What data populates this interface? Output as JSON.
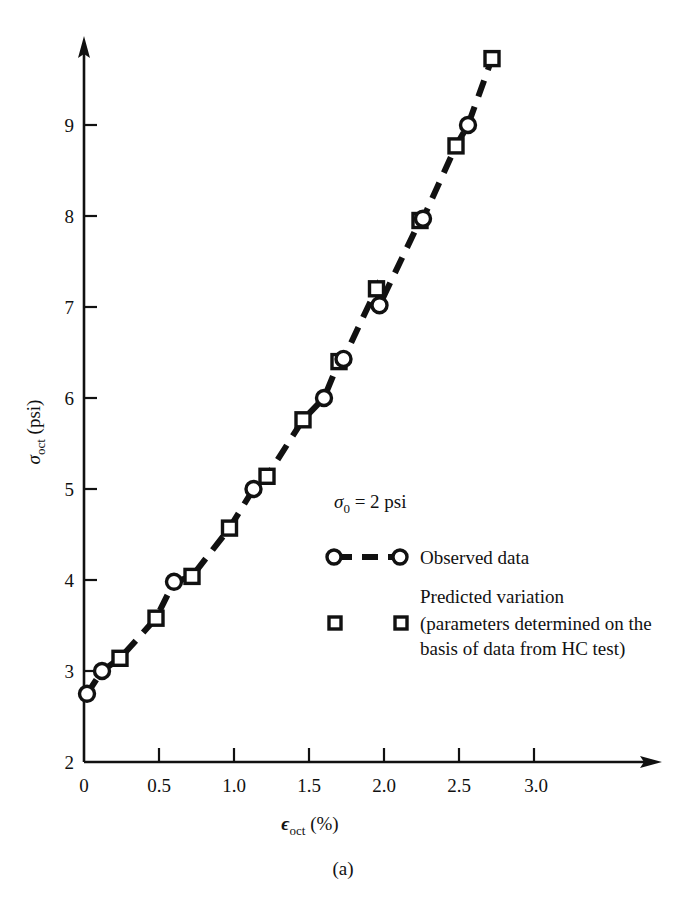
{
  "figure": {
    "caption": "(a)",
    "annotation": "= 2 psi",
    "annotation_symbol": "σ",
    "annotation_subscript": "0"
  },
  "axes": {
    "y_title_symbol": "σ",
    "y_title_sub": "oct",
    "y_title_unit": "(psi)",
    "x_title_symbol": "ϵ",
    "x_title_sub": "oct",
    "x_title_unit": "(%)",
    "x_ticks": [
      "0",
      "0.5",
      "1.0",
      "1.5",
      "2.0",
      "2.5",
      "3.0"
    ],
    "y_ticks": [
      "2",
      "3",
      "4",
      "5",
      "6",
      "7",
      "8",
      "9"
    ]
  },
  "legend": {
    "items": [
      {
        "marker": "circle-dashed-line",
        "label": "Observed data"
      },
      {
        "marker": "open-square",
        "label_line1": "Predicted variation",
        "label_line2": "(parameters determined on the",
        "label_line3": "basis of data from HC test)"
      }
    ]
  },
  "colors": {
    "ink": "#111111",
    "paper": "#ffffff"
  },
  "chart_data": {
    "type": "scatter",
    "title": "",
    "xlabel": "ϵ_oct (%)",
    "ylabel": "σ_oct (psi)",
    "xlim": [
      0,
      3.35
    ],
    "ylim": [
      2,
      9.9
    ],
    "grid": false,
    "legend_position": "center-right",
    "annotations": [
      {
        "text": "σ_0 = 2 psi",
        "x": 1.67,
        "y": 5.1
      }
    ],
    "series": [
      {
        "name": "Observed data",
        "marker": "circle",
        "line": "dashed",
        "points": [
          {
            "x": 0.02,
            "y": 2.75
          },
          {
            "x": 0.12,
            "y": 3.0
          },
          {
            "x": 0.6,
            "y": 3.98
          },
          {
            "x": 1.13,
            "y": 5.0
          },
          {
            "x": 1.6,
            "y": 6.0
          },
          {
            "x": 1.73,
            "y": 6.43
          },
          {
            "x": 1.97,
            "y": 7.02
          },
          {
            "x": 2.26,
            "y": 7.97
          },
          {
            "x": 2.56,
            "y": 9.0
          }
        ]
      },
      {
        "name": "Predicted variation",
        "marker": "open-square",
        "line": "none",
        "points": [
          {
            "x": 0.24,
            "y": 3.14
          },
          {
            "x": 0.48,
            "y": 3.58
          },
          {
            "x": 0.72,
            "y": 4.04
          },
          {
            "x": 0.97,
            "y": 4.57
          },
          {
            "x": 1.22,
            "y": 5.14
          },
          {
            "x": 1.46,
            "y": 5.76
          },
          {
            "x": 1.7,
            "y": 6.4
          },
          {
            "x": 1.95,
            "y": 7.2
          },
          {
            "x": 2.24,
            "y": 7.95
          },
          {
            "x": 2.48,
            "y": 8.77
          },
          {
            "x": 2.72,
            "y": 9.73
          }
        ]
      }
    ]
  }
}
